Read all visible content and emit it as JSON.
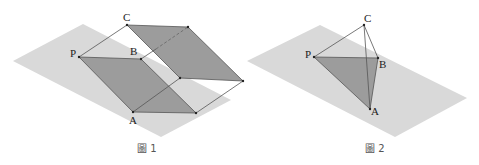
{
  "figure1": {
    "caption": "圖 1",
    "labels": {
      "P": "P",
      "B": "B",
      "C": "C",
      "A": "A"
    },
    "colors": {
      "plane": "#d6d6d6",
      "face": "#9a9a9a",
      "edge": "#555555"
    }
  },
  "figure2": {
    "caption": "圖 2",
    "labels": {
      "P": "P",
      "B": "B",
      "C": "C",
      "A": "A"
    },
    "colors": {
      "plane": "#d6d6d6",
      "face": "#9a9a9a",
      "edge": "#555555"
    }
  }
}
